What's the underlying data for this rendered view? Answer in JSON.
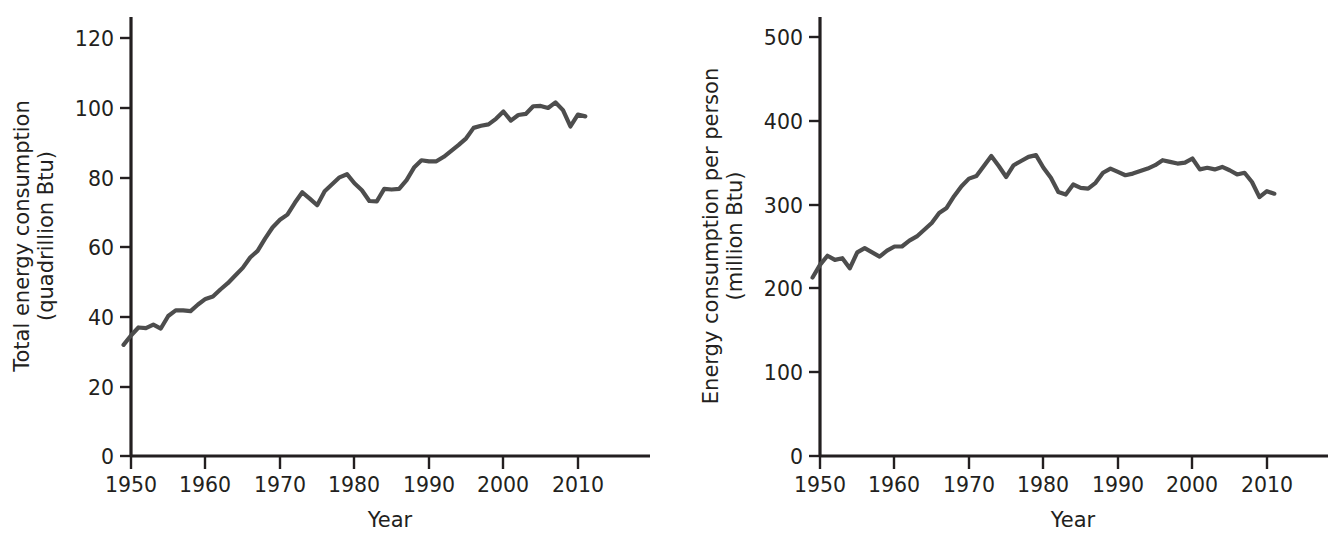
{
  "figure": {
    "background_color": "#ffffff",
    "line_color": "#4d4d4d",
    "axis_color": "#231f20",
    "panel_count": 2
  },
  "chart_data": [
    {
      "type": "line",
      "panel": "left",
      "title": "",
      "xlabel": "Year",
      "ylabel": "Total energy consumption\n(quadrillion Btu)",
      "ylabel_line1": "Total energy consumption",
      "ylabel_line2": "(quadrillion Btu)",
      "units": "quadrillion Btu",
      "grid": false,
      "legend": false,
      "xlim": [
        1948,
        2013
      ],
      "ylim": [
        0,
        126
      ],
      "xticks": [
        1950,
        1960,
        1970,
        1980,
        1990,
        2000,
        2010
      ],
      "xtick_labels": [
        "1950",
        "1960",
        "1970",
        "1980",
        "1990",
        "2000",
        "2010"
      ],
      "yticks": [
        0,
        20,
        40,
        60,
        80,
        100,
        120
      ],
      "ytick_labels": [
        "0",
        "20",
        "40",
        "60",
        "80",
        "100",
        "120"
      ],
      "x": [
        1949,
        1950,
        1951,
        1952,
        1953,
        1954,
        1955,
        1956,
        1957,
        1958,
        1959,
        1960,
        1961,
        1962,
        1963,
        1964,
        1965,
        1966,
        1967,
        1968,
        1969,
        1970,
        1971,
        1972,
        1973,
        1974,
        1975,
        1976,
        1977,
        1978,
        1979,
        1980,
        1981,
        1982,
        1983,
        1984,
        1985,
        1986,
        1987,
        1988,
        1989,
        1990,
        1991,
        1992,
        1993,
        1994,
        1995,
        1996,
        1997,
        1998,
        1999,
        2000,
        2001,
        2002,
        2003,
        2004,
        2005,
        2006,
        2007,
        2008,
        2009,
        2010,
        2011
      ],
      "values": [
        31.9,
        34.6,
        36.9,
        36.7,
        37.7,
        36.6,
        40.2,
        41.8,
        41.8,
        41.6,
        43.5,
        45.1,
        45.8,
        47.8,
        49.6,
        51.8,
        54.0,
        57.0,
        58.9,
        62.4,
        65.6,
        67.8,
        69.3,
        72.7,
        75.7,
        73.9,
        72.0,
        76.0,
        78.0,
        80.0,
        80.9,
        78.3,
        76.3,
        73.2,
        73.1,
        76.7,
        76.5,
        76.7,
        79.2,
        82.8,
        84.9,
        84.6,
        84.6,
        85.9,
        87.6,
        89.3,
        91.2,
        94.2,
        94.8,
        95.2,
        96.8,
        98.9,
        96.3,
        97.9,
        98.2,
        100.4,
        100.5,
        99.9,
        101.5,
        99.3,
        94.6,
        98.0,
        97.5
      ]
    },
    {
      "type": "line",
      "panel": "right",
      "title": "",
      "xlabel": "Year",
      "ylabel": "Energy consumption per person\n(million Btu)",
      "ylabel_line1": "Energy consumption per person",
      "ylabel_line2": "(million Btu)",
      "units": "million Btu",
      "grid": false,
      "legend": false,
      "xlim": [
        1948,
        2013
      ],
      "ylim": [
        0,
        525
      ],
      "xticks": [
        1950,
        1960,
        1970,
        1980,
        1990,
        2000,
        2010
      ],
      "xtick_labels": [
        "1950",
        "1960",
        "1970",
        "1980",
        "1990",
        "2000",
        "2010"
      ],
      "yticks": [
        0,
        100,
        200,
        300,
        400,
        500
      ],
      "ytick_labels": [
        "0",
        "100",
        "200",
        "300",
        "400",
        "500"
      ],
      "x": [
        1949,
        1950,
        1951,
        1952,
        1953,
        1954,
        1955,
        1956,
        1957,
        1958,
        1959,
        1960,
        1961,
        1962,
        1963,
        1964,
        1965,
        1966,
        1967,
        1968,
        1969,
        1970,
        1971,
        1972,
        1973,
        1974,
        1975,
        1976,
        1977,
        1978,
        1979,
        1980,
        1981,
        1982,
        1983,
        1984,
        1985,
        1986,
        1987,
        1988,
        1989,
        1990,
        1991,
        1992,
        1993,
        1994,
        1995,
        1996,
        1997,
        1998,
        1999,
        2000,
        2001,
        2002,
        2003,
        2004,
        2005,
        2006,
        2007,
        2008,
        2009,
        2010,
        2011
      ],
      "values": [
        213,
        228,
        239,
        234,
        236,
        224,
        243,
        248,
        243,
        238,
        245,
        250,
        250,
        257,
        262,
        270,
        278,
        290,
        296,
        310,
        322,
        331,
        334,
        346,
        358,
        346,
        333,
        347,
        352,
        357,
        359,
        344,
        332,
        315,
        312,
        324,
        320,
        319,
        326,
        338,
        343,
        339,
        335,
        337,
        340,
        343,
        347,
        353,
        351,
        349,
        350,
        355,
        342,
        344,
        342,
        345,
        341,
        336,
        338,
        327,
        309,
        316,
        313
      ]
    }
  ],
  "panels": {
    "left": {
      "name": "total-energy-consumption-chart",
      "x_axis_title": "Year",
      "y_axis_title_line1": "Total energy consumption",
      "y_axis_title_line2": "(quadrillion Btu)"
    },
    "right": {
      "name": "energy-consumption-per-person-chart",
      "x_axis_title": "Year",
      "y_axis_title_line1": "Energy consumption per person",
      "y_axis_title_line2": "(million Btu)"
    }
  }
}
